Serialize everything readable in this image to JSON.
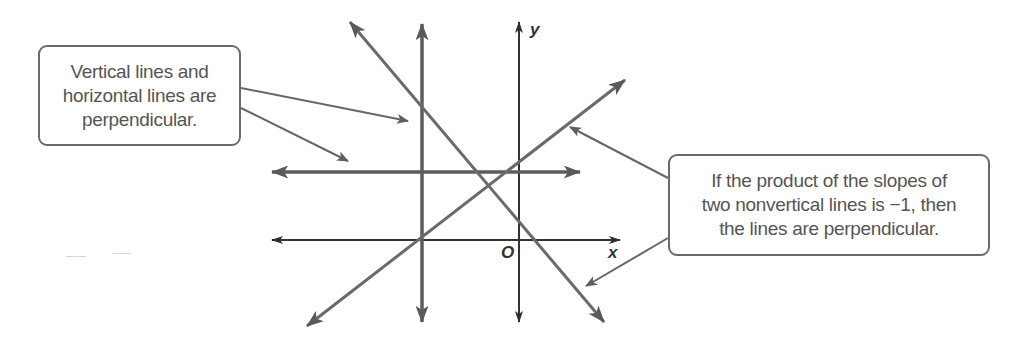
{
  "callouts": {
    "left": {
      "lines": [
        "Vertical lines and",
        "horizontal lines are",
        "perpendicular."
      ]
    },
    "right": {
      "lines": [
        "If the product of the slopes of",
        "two nonvertical lines is −1, then",
        "the lines are  perpendicular."
      ]
    }
  },
  "axes": {
    "x_label": "x",
    "y_label": "y",
    "origin_label": "O"
  },
  "colors": {
    "line_dark": "#3a3a3a",
    "line_gray": "#6b6b6b",
    "box_border": "#6a6a6a",
    "text": "#555555"
  },
  "lines": [
    {
      "name": "vertical-line",
      "description": "vertical line",
      "from": [
        422,
        24
      ],
      "to": [
        422,
        322
      ]
    },
    {
      "name": "horizontal-line",
      "description": "horizontal line",
      "from": [
        272,
        172
      ],
      "to": [
        580,
        172
      ]
    },
    {
      "name": "decreasing-line",
      "description": "line with negative slope",
      "from": [
        350,
        22
      ],
      "to": [
        604,
        322
      ]
    },
    {
      "name": "increasing-line",
      "description": "line with positive slope",
      "from": [
        307,
        326
      ],
      "to": [
        625,
        80
      ]
    },
    {
      "name": "x-axis",
      "from": [
        272,
        240
      ],
      "to": [
        620,
        240
      ]
    },
    {
      "name": "y-axis",
      "from": [
        519,
        22
      ],
      "to": [
        519,
        322
      ]
    }
  ]
}
